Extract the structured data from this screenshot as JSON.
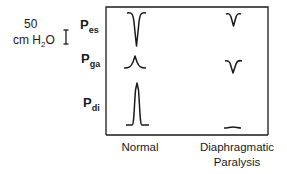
{
  "scale": {
    "value": "50",
    "unit_main": "cm H",
    "unit_sub": "2",
    "unit_end": "O",
    "icon": "scale-bar-icon"
  },
  "pressure_labels": [
    {
      "main": "P",
      "sub": "es"
    },
    {
      "main": "P",
      "sub": "ga"
    },
    {
      "main": "P",
      "sub": "di"
    }
  ],
  "conditions": [
    {
      "label": "Normal"
    },
    {
      "label_line1": "Diaphragmatic",
      "label_line2": "Paralysis"
    }
  ],
  "traces": {
    "normal": {
      "pes": "large negative deflection",
      "pga": "small positive deflection",
      "pdi": "large positive deflection"
    },
    "diaphragmatic_paralysis": {
      "pes": "small negative deflection",
      "pga": "small negative deflection",
      "pdi": "flat"
    }
  },
  "colors": {
    "ink": "#1a1a1a",
    "background": "#ffffff"
  }
}
